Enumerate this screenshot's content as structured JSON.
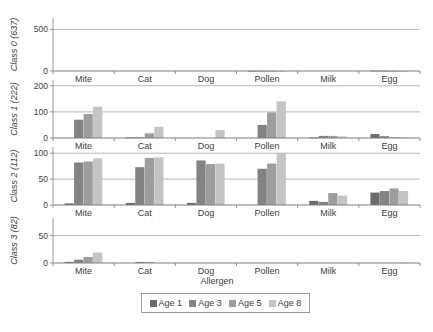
{
  "chart_data": {
    "type": "bar",
    "layout": "small-multiples (4 stacked panels, shared x categories)",
    "xlabel": "Allergen",
    "categories": [
      "Mite",
      "Cat",
      "Dog",
      "Pollen",
      "Milk",
      "Egg"
    ],
    "legend": {
      "position": "bottom",
      "entries": [
        "Age 1",
        "Age 3",
        "Age 5",
        "Age 8"
      ]
    },
    "series_colors": {
      "Age 1": "#6b6b6b",
      "Age 3": "#838383",
      "Age 5": "#9d9d9d",
      "Age 8": "#c4c4c4"
    },
    "panels": [
      {
        "ylabel": "Class 0 (637)",
        "ylim": [
          0,
          637
        ],
        "yticks": [
          0,
          500
        ],
        "grid": true,
        "series": [
          {
            "name": "Age 1",
            "values": [
              0,
              0,
              0,
              3,
              0,
              5
            ]
          },
          {
            "name": "Age 3",
            "values": [
              0,
              0,
              0,
              3,
              0,
              3
            ]
          },
          {
            "name": "Age 5",
            "values": [
              0,
              0,
              0,
              2,
              0,
              2
            ]
          },
          {
            "name": "Age 8",
            "values": [
              0,
              0,
              0,
              2,
              0,
              1
            ]
          }
        ]
      },
      {
        "ylabel": "Class 1 (222)",
        "ylim": [
          0,
          222
        ],
        "yticks": [
          0,
          100,
          200
        ],
        "grid": true,
        "series": [
          {
            "name": "Age 1",
            "values": [
              0,
              2,
              0,
              0,
              2,
              15
            ]
          },
          {
            "name": "Age 3",
            "values": [
              70,
              3,
              0,
              50,
              8,
              7
            ]
          },
          {
            "name": "Age 5",
            "values": [
              92,
              18,
              0,
              98,
              8,
              3
            ]
          },
          {
            "name": "Age 8",
            "values": [
              120,
              43,
              30,
              140,
              6,
              2
            ]
          }
        ]
      },
      {
        "ylabel": "Class 2 (112)",
        "ylim": [
          0,
          112
        ],
        "yticks": [
          0,
          50,
          100
        ],
        "grid": true,
        "series": [
          {
            "name": "Age 1",
            "values": [
              3,
              4,
              4,
              0,
              8,
              24
            ]
          },
          {
            "name": "Age 3",
            "values": [
              82,
              73,
              86,
              70,
              6,
              27
            ]
          },
          {
            "name": "Age 5",
            "values": [
              84,
              91,
              79,
              80,
              23,
              32
            ]
          },
          {
            "name": "Age 8",
            "values": [
              90,
              92,
              80,
              100,
              18,
              27
            ]
          }
        ]
      },
      {
        "ylabel": "Class 3 (82)",
        "ylim": [
          0,
          82
        ],
        "yticks": [
          0,
          50
        ],
        "grid": true,
        "series": [
          {
            "name": "Age 1",
            "values": [
              2,
              0,
              0,
              0,
              0,
              0
            ]
          },
          {
            "name": "Age 3",
            "values": [
              6,
              2,
              0,
              0,
              0,
              0
            ]
          },
          {
            "name": "Age 5",
            "values": [
              11,
              2,
              0,
              0,
              0,
              0
            ]
          },
          {
            "name": "Age 8",
            "values": [
              19,
              0,
              0,
              0,
              0,
              1
            ]
          }
        ]
      }
    ]
  }
}
